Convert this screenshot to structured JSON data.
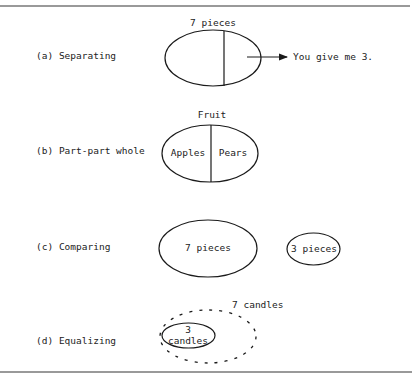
{
  "diagram": {
    "panels": [
      {
        "id": "a",
        "label": "(a) Separating",
        "whole_label": "7 pieces",
        "result_label": "You give me 3."
      },
      {
        "id": "b",
        "label": "(b) Part-part whole",
        "whole_label": "Fruit",
        "part_left": "Apples",
        "part_right": "Pears"
      },
      {
        "id": "c",
        "label": "(c) Comparing",
        "large_set": "7 pieces",
        "small_set": "3 pieces"
      },
      {
        "id": "d",
        "label": "(d) Equalizing",
        "outer_label": "7 candles",
        "inner_line1": "3",
        "inner_line2": "candles"
      }
    ]
  }
}
